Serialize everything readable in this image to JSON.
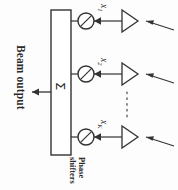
{
  "figure": {
    "type": "phased-array-beamformer-block-diagram",
    "orientation_note": "all text rendered rotated 90 degrees",
    "beam_output_label": "Beam output",
    "summation_symbol": "Σ",
    "phase_shifters_label_line1": "Phase",
    "phase_shifters_label_line2": "shifters",
    "ellipsis_glyph": "⋮",
    "line_color": "#333333",
    "text_color": "#2b2b2b",
    "background_color": "#fdfdfd",
    "branches": [
      {
        "signal_label": "x",
        "subscript": "1"
      },
      {
        "signal_label": "x",
        "subscript": "2"
      },
      {
        "signal_label": "x",
        "subscript": "K"
      }
    ]
  }
}
